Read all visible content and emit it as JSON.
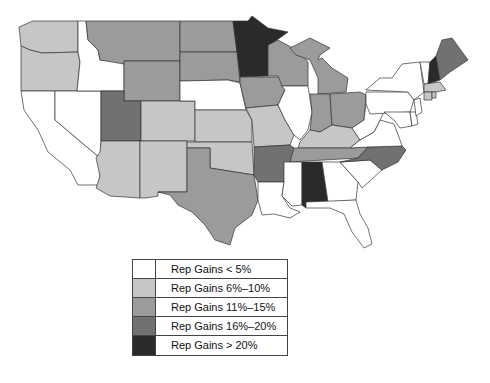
{
  "colors": {
    "lt5": "#ffffff",
    "6to10": "#c6c6c6",
    "11to15": "#9b9b9b",
    "16to20": "#717171",
    "gt20": "#2a2a2a"
  },
  "legend": {
    "items": [
      {
        "label": "Rep Gains < 5%",
        "color": "#ffffff"
      },
      {
        "label": "Rep Gains 6%–10%",
        "color": "#c6c6c6"
      },
      {
        "label": "Rep Gains 11%–15%",
        "color": "#9b9b9b"
      },
      {
        "label": "Rep Gains 16%–20%",
        "color": "#717171"
      },
      {
        "label": "Rep Gains > 20%",
        "color": "#2a2a2a"
      }
    ]
  },
  "states": {
    "lt5": [
      "ID",
      "NV",
      "CA",
      "NE",
      "IL",
      "MS",
      "GA",
      "SC",
      "FL",
      "WV",
      "VA",
      "PA",
      "NY",
      "VT",
      "NJ",
      "DE",
      "MD",
      "LA"
    ],
    "6to10": [
      "WA",
      "OR",
      "CO",
      "AZ",
      "NM",
      "KS",
      "OK",
      "MO",
      "KY",
      "CT",
      "MA",
      "RI"
    ],
    "11to15": [
      "MT",
      "ND",
      "SD",
      "WY",
      "WI",
      "MI",
      "IA",
      "IN",
      "OH",
      "TX",
      "TN"
    ],
    "16to20": [
      "UT",
      "AR",
      "NC",
      "ME"
    ],
    "gt20": [
      "MN",
      "AL",
      "NH"
    ]
  }
}
